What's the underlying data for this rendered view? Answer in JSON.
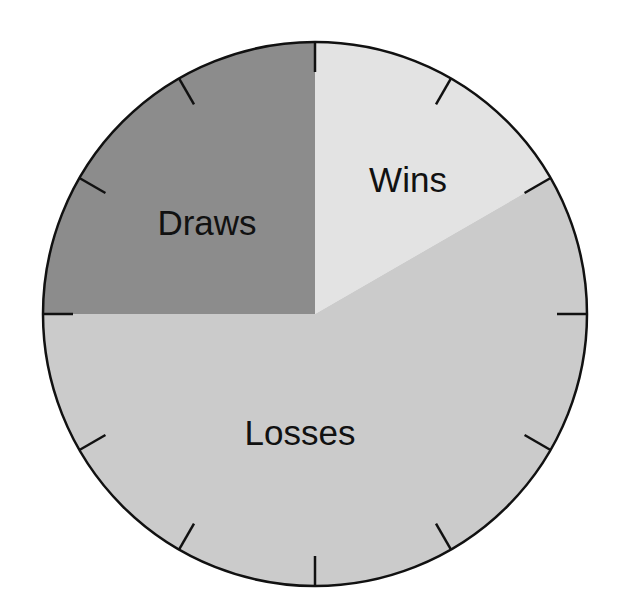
{
  "chart_data": {
    "type": "pie",
    "title": "",
    "categories": [
      "Wins",
      "Losses",
      "Draws"
    ],
    "values": [
      2,
      7,
      3
    ],
    "fractions": [
      0.1667,
      0.5833,
      0.25
    ],
    "units": "twelfths of the circle",
    "start_angle_deg": 0,
    "direction": "clockwise from 12 o'clock",
    "colors": [
      "#e3e3e3",
      "#cbcbcb",
      "#8c8c8c"
    ],
    "tick_marks": 12,
    "legend": "none (labels inside slices)"
  },
  "labels": {
    "wins": "Wins",
    "losses": "Losses",
    "draws": "Draws"
  },
  "style": {
    "outline_color": "#111111"
  }
}
